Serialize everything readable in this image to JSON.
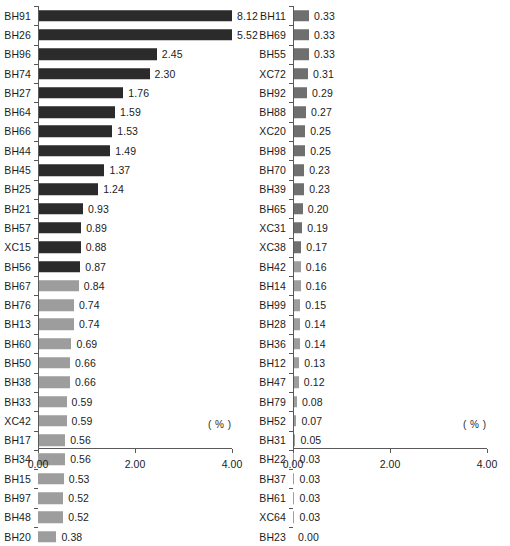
{
  "chart_data": {
    "type": "bar",
    "orientation": "horizontal",
    "title": "",
    "xlabel": "( % )",
    "ylabel": "",
    "xlim": [
      0.0,
      4.0
    ],
    "xticks": [
      "0.00",
      "2.00",
      "4.00"
    ],
    "xtick_values": [
      0.0,
      2.0,
      4.0
    ],
    "grid": false,
    "legend": null,
    "unit_note": "( % )",
    "panels": [
      {
        "name": "left-panel",
        "categories": [
          "BH91",
          "BH26",
          "BH96",
          "BH74",
          "BH27",
          "BH64",
          "BH66",
          "BH44",
          "BH45",
          "BH25",
          "BH21",
          "BH57",
          "XC15",
          "BH56",
          "BH67",
          "BH76",
          "BH13",
          "BH60",
          "BH50",
          "BH38",
          "BH33",
          "XC42",
          "BH17",
          "BH34",
          "BH15",
          "BH97",
          "BH48",
          "BH20"
        ],
        "values": [
          8.12,
          5.52,
          2.45,
          2.3,
          1.76,
          1.59,
          1.53,
          1.49,
          1.37,
          1.24,
          0.93,
          0.89,
          0.88,
          0.87,
          0.84,
          0.74,
          0.74,
          0.69,
          0.66,
          0.66,
          0.59,
          0.59,
          0.56,
          0.56,
          0.53,
          0.52,
          0.52,
          0.38
        ],
        "labels": [
          "8.12",
          "5.52",
          "2.45",
          "2.30",
          "1.76",
          "1.59",
          "1.53",
          "1.49",
          "1.37",
          "1.24",
          "0.93",
          "0.89",
          "0.88",
          "0.87",
          "0.84",
          "0.74",
          "0.74",
          "0.69",
          "0.66",
          "0.66",
          "0.59",
          "0.59",
          "0.56",
          "0.56",
          "0.53",
          "0.52",
          "0.52",
          "0.38"
        ],
        "shades": [
          "dark",
          "dark",
          "dark",
          "dark",
          "dark",
          "dark",
          "dark",
          "dark",
          "dark",
          "dark",
          "dark",
          "dark",
          "dark",
          "dark",
          "light",
          "light",
          "light",
          "light",
          "light",
          "light",
          "light",
          "light",
          "light",
          "light",
          "light",
          "light",
          "light",
          "light"
        ]
      },
      {
        "name": "right-panel",
        "categories": [
          "BH11",
          "BH69",
          "BH55",
          "XC72",
          "BH92",
          "BH88",
          "XC20",
          "BH98",
          "BH70",
          "BH39",
          "BH65",
          "XC31",
          "XC38",
          "BH42",
          "BH14",
          "BH99",
          "BH28",
          "BH36",
          "BH12",
          "BH47",
          "BH79",
          "BH52",
          "BH31",
          "BH22",
          "BH37",
          "BH61",
          "XC64",
          "BH23"
        ],
        "values": [
          0.33,
          0.33,
          0.33,
          0.31,
          0.29,
          0.27,
          0.25,
          0.25,
          0.23,
          0.23,
          0.2,
          0.19,
          0.17,
          0.16,
          0.16,
          0.15,
          0.14,
          0.14,
          0.13,
          0.12,
          0.08,
          0.07,
          0.05,
          0.03,
          0.03,
          0.03,
          0.03,
          0.0
        ],
        "labels": [
          "0.33",
          "0.33",
          "0.33",
          "0.31",
          "0.29",
          "0.27",
          "0.25",
          "0.25",
          "0.23",
          "0.23",
          "0.20",
          "0.19",
          "0.17",
          "0.16",
          "0.16",
          "0.15",
          "0.14",
          "0.14",
          "0.13",
          "0.12",
          "0.08",
          "0.07",
          "0.05",
          "0.03",
          "0.03",
          "0.03",
          "0.03",
          "0.00"
        ],
        "shades": [
          "mid",
          "mid",
          "mid",
          "mid",
          "mid",
          "mid",
          "mid",
          "mid",
          "mid",
          "mid",
          "mid",
          "mid",
          "mid",
          "light",
          "light",
          "light",
          "light",
          "light",
          "light",
          "light",
          "light",
          "light",
          "light",
          "light",
          "light",
          "light",
          "light",
          "light"
        ]
      }
    ]
  },
  "colors": {
    "bar_dark": "#2b2b2b",
    "bar_mid": "#6f6f6f",
    "bar_light": "#9d9d9d",
    "axis": "#5a5a5a",
    "text": "#1c1c1c",
    "background": "#ffffff"
  },
  "bottom_caption": ""
}
